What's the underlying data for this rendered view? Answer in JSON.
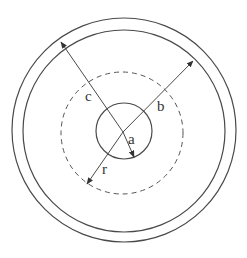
{
  "diagram": {
    "colors": {
      "stroke": "#4a4a4a",
      "text": "#333333",
      "background": "#ffffff"
    },
    "labels": {
      "a": "a",
      "b": "b",
      "c": "c",
      "r": "r"
    },
    "circles": [
      {
        "name": "inner-conductor",
        "radius_label": "a",
        "style": "solid"
      },
      {
        "name": "gaussian-surface",
        "radius_label": "r",
        "style": "dashed"
      },
      {
        "name": "shell-inner-surface",
        "radius_label": "b",
        "style": "solid"
      },
      {
        "name": "shell-outer-surface",
        "radius_label": "c",
        "style": "solid"
      }
    ]
  }
}
